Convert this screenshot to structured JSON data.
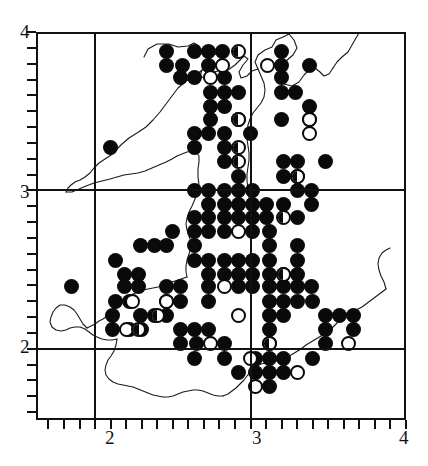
{
  "figure": {
    "type": "distribution-map",
    "region_outline": "wales-coastline"
  },
  "axes": {
    "x": {
      "labels": [
        "2",
        "3",
        "4"
      ],
      "values": [
        2,
        3,
        4
      ],
      "min": 1.62,
      "max": 4.0,
      "minor_tick_step": 0.1
    },
    "y": {
      "labels": [
        "2",
        "3",
        "4"
      ],
      "values": [
        2,
        3,
        4
      ],
      "min": 1.55,
      "max": 4.0,
      "minor_tick_step": 0.1
    }
  },
  "legend_symbols": [
    {
      "key": "filled",
      "name": "filled-circle"
    },
    {
      "key": "open",
      "name": "open-circle"
    },
    {
      "key": "half",
      "name": "half-filled-circle"
    }
  ],
  "chart_data": {
    "type": "scatter",
    "title": "",
    "xlabel": "",
    "ylabel": "",
    "xlim": [
      1.62,
      4.0
    ],
    "ylim": [
      1.55,
      4.0
    ],
    "grid": true,
    "gridlines_x": [
      2,
      3
    ],
    "gridlines_y": [
      2,
      3
    ],
    "series": [
      {
        "name": "filled-circle",
        "symbol": "filled",
        "points": [
          [
            2.46,
            3.88
          ],
          [
            2.64,
            3.88
          ],
          [
            2.73,
            3.88
          ],
          [
            2.82,
            3.88
          ],
          [
            3.2,
            3.88
          ],
          [
            2.46,
            3.79
          ],
          [
            2.56,
            3.79
          ],
          [
            2.73,
            3.79
          ],
          [
            3.2,
            3.79
          ],
          [
            3.38,
            3.79
          ],
          [
            2.55,
            3.71
          ],
          [
            2.64,
            3.71
          ],
          [
            2.83,
            3.71
          ],
          [
            3.2,
            3.71
          ],
          [
            2.74,
            3.62
          ],
          [
            2.83,
            3.62
          ],
          [
            3.2,
            3.62
          ],
          [
            3.29,
            3.62
          ],
          [
            2.74,
            3.53
          ],
          [
            2.83,
            3.53
          ],
          [
            3.38,
            3.53
          ],
          [
            2.74,
            3.45
          ],
          [
            2.92,
            3.45
          ],
          [
            3.2,
            3.45
          ],
          [
            3.38,
            3.45
          ],
          [
            2.64,
            3.36
          ],
          [
            2.73,
            3.36
          ],
          [
            2.83,
            3.36
          ],
          [
            3.0,
            3.36
          ],
          [
            2.64,
            3.27
          ],
          [
            2.83,
            3.27
          ],
          [
            2.1,
            3.27
          ],
          [
            2.83,
            3.18
          ],
          [
            3.21,
            3.18
          ],
          [
            3.3,
            3.18
          ],
          [
            3.48,
            3.18
          ],
          [
            2.92,
            3.09
          ],
          [
            3.21,
            3.09
          ],
          [
            3.3,
            3.09
          ],
          [
            2.64,
            3.0
          ],
          [
            2.73,
            3.0
          ],
          [
            2.83,
            3.0
          ],
          [
            2.92,
            3.0
          ],
          [
            3.01,
            3.0
          ],
          [
            3.3,
            3.0
          ],
          [
            3.39,
            3.0
          ],
          [
            2.73,
            2.91
          ],
          [
            2.83,
            2.91
          ],
          [
            2.92,
            2.91
          ],
          [
            3.01,
            2.91
          ],
          [
            3.1,
            2.91
          ],
          [
            3.21,
            2.91
          ],
          [
            3.39,
            2.91
          ],
          [
            2.64,
            2.83
          ],
          [
            2.73,
            2.83
          ],
          [
            2.83,
            2.83
          ],
          [
            2.92,
            2.83
          ],
          [
            3.01,
            2.83
          ],
          [
            3.1,
            2.83
          ],
          [
            3.3,
            2.83
          ],
          [
            2.5,
            2.74
          ],
          [
            2.64,
            2.74
          ],
          [
            2.73,
            2.74
          ],
          [
            2.83,
            2.74
          ],
          [
            3.01,
            2.74
          ],
          [
            3.12,
            2.74
          ],
          [
            2.29,
            2.65
          ],
          [
            2.38,
            2.65
          ],
          [
            2.46,
            2.65
          ],
          [
            2.64,
            2.65
          ],
          [
            3.12,
            2.65
          ],
          [
            3.3,
            2.65
          ],
          [
            2.13,
            2.56
          ],
          [
            2.64,
            2.56
          ],
          [
            2.73,
            2.56
          ],
          [
            2.83,
            2.56
          ],
          [
            2.92,
            2.56
          ],
          [
            3.01,
            2.56
          ],
          [
            3.12,
            2.56
          ],
          [
            3.3,
            2.56
          ],
          [
            2.19,
            2.47
          ],
          [
            2.28,
            2.47
          ],
          [
            2.73,
            2.47
          ],
          [
            2.83,
            2.47
          ],
          [
            2.92,
            2.47
          ],
          [
            3.01,
            2.47
          ],
          [
            3.12,
            2.47
          ],
          [
            3.21,
            2.47
          ],
          [
            3.3,
            2.47
          ],
          [
            2.19,
            2.39
          ],
          [
            2.28,
            2.39
          ],
          [
            2.46,
            2.39
          ],
          [
            2.55,
            2.39
          ],
          [
            2.73,
            2.39
          ],
          [
            2.92,
            2.39
          ],
          [
            3.01,
            2.39
          ],
          [
            3.12,
            2.39
          ],
          [
            3.21,
            2.39
          ],
          [
            3.3,
            2.39
          ],
          [
            3.39,
            2.39
          ],
          [
            1.85,
            2.39
          ],
          [
            2.13,
            2.3
          ],
          [
            2.22,
            2.3
          ],
          [
            2.46,
            2.3
          ],
          [
            2.55,
            2.3
          ],
          [
            2.73,
            2.3
          ],
          [
            3.12,
            2.3
          ],
          [
            3.21,
            2.3
          ],
          [
            3.3,
            2.3
          ],
          [
            3.4,
            2.3
          ],
          [
            2.11,
            2.21
          ],
          [
            2.29,
            2.21
          ],
          [
            2.38,
            2.21
          ],
          [
            2.46,
            2.21
          ],
          [
            3.12,
            2.21
          ],
          [
            3.21,
            2.21
          ],
          [
            3.48,
            2.21
          ],
          [
            3.57,
            2.21
          ],
          [
            3.66,
            2.21
          ],
          [
            2.11,
            2.12
          ],
          [
            2.22,
            2.12
          ],
          [
            2.3,
            2.12
          ],
          [
            2.55,
            2.12
          ],
          [
            2.64,
            2.12
          ],
          [
            2.73,
            2.12
          ],
          [
            3.12,
            2.12
          ],
          [
            3.48,
            2.12
          ],
          [
            3.66,
            2.12
          ],
          [
            2.55,
            2.03
          ],
          [
            2.65,
            2.03
          ],
          [
            2.83,
            2.03
          ],
          [
            3.12,
            2.03
          ],
          [
            3.48,
            2.03
          ],
          [
            2.64,
            1.94
          ],
          [
            2.83,
            1.94
          ],
          [
            3.03,
            1.94
          ],
          [
            3.12,
            1.94
          ],
          [
            3.21,
            1.94
          ],
          [
            3.4,
            1.94
          ],
          [
            2.92,
            1.85
          ],
          [
            3.03,
            1.85
          ],
          [
            3.12,
            1.85
          ],
          [
            3.21,
            1.85
          ],
          [
            3.12,
            1.76
          ],
          [
            2.92,
            3.62
          ]
        ]
      },
      {
        "name": "open-circle",
        "symbol": "open",
        "points": [
          [
            2.82,
            3.79
          ],
          [
            3.11,
            3.79
          ],
          [
            2.74,
            3.71
          ],
          [
            3.38,
            3.45
          ],
          [
            3.38,
            3.36
          ],
          [
            2.92,
            2.74
          ],
          [
            2.83,
            2.39
          ],
          [
            2.24,
            2.3
          ],
          [
            2.46,
            2.3
          ],
          [
            2.92,
            2.21
          ],
          [
            2.74,
            2.03
          ],
          [
            3.0,
            1.94
          ],
          [
            3.3,
            1.85
          ],
          [
            3.03,
            1.76
          ],
          [
            3.63,
            2.03
          ],
          [
            2.2,
            2.12
          ]
        ]
      },
      {
        "name": "half-filled-circle",
        "symbol": "half",
        "points": [
          [
            2.92,
            3.88
          ],
          [
            2.92,
            3.45
          ],
          [
            2.92,
            3.27
          ],
          [
            2.92,
            3.18
          ],
          [
            3.3,
            3.09
          ],
          [
            3.21,
            2.83
          ],
          [
            3.21,
            2.47
          ],
          [
            2.4,
            2.21
          ],
          [
            2.28,
            2.12
          ],
          [
            3.12,
            2.03
          ]
        ]
      }
    ]
  }
}
